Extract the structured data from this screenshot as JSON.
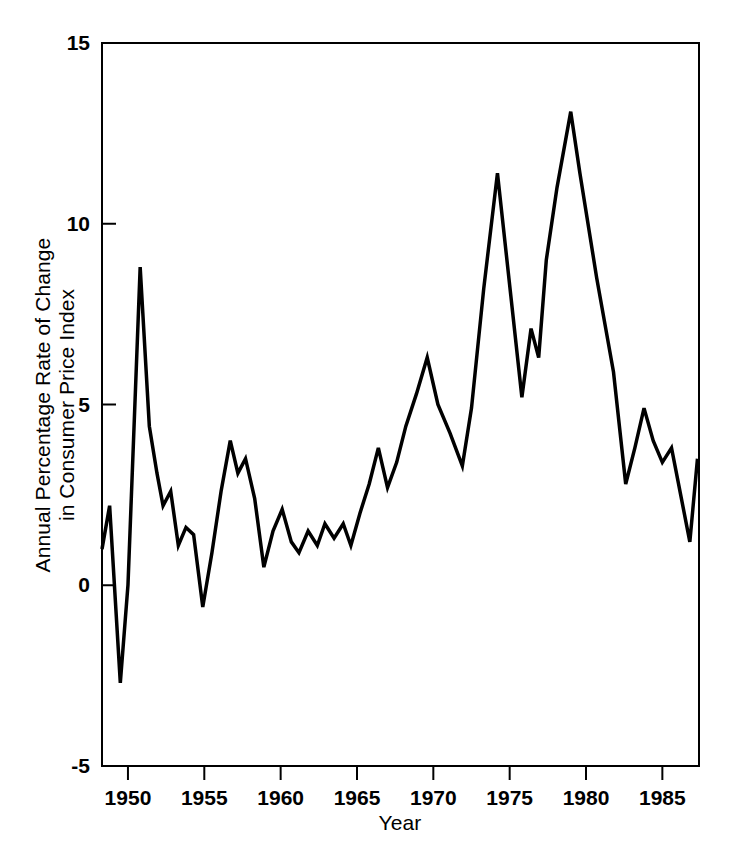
{
  "chart_data": {
    "type": "line",
    "title": "",
    "subtitle": "",
    "xlabel": "Year",
    "ylabel": "Annual Percentage Rate of Change in Consumer Price Index",
    "ylabel_line1": "Annual Percentage Rate of Change",
    "ylabel_line2": "in Consumer Price Index",
    "xlim": [
      1948.3,
      1987.4
    ],
    "ylim": [
      -5,
      15
    ],
    "xticks": [
      1950,
      1955,
      1960,
      1965,
      1970,
      1975,
      1980,
      1985
    ],
    "xtick_labels": [
      "1950",
      "1955",
      "1960",
      "1965",
      "1970",
      "1975",
      "1980",
      "1985"
    ],
    "yticks": [
      -5,
      0,
      5,
      10,
      15
    ],
    "ytick_labels": [
      "-5",
      "0",
      "5",
      "10",
      "15"
    ],
    "grid": false,
    "legend": null,
    "line_color": "#000000",
    "line_width": 3.5,
    "frame_color": "#000000",
    "background": "#ffffff",
    "series": [
      {
        "name": "Annual Percentage Rate of Change in Consumer Price Index",
        "x": [
          1948.3,
          1948.8,
          1949.5,
          1950.0,
          1950.8,
          1951.4,
          1951.9,
          1952.3,
          1952.8,
          1953.3,
          1953.8,
          1954.3,
          1954.9,
          1955.5,
          1956.1,
          1956.7,
          1957.2,
          1957.7,
          1958.3,
          1958.9,
          1959.5,
          1960.1,
          1960.7,
          1961.2,
          1961.8,
          1962.4,
          1962.9,
          1963.5,
          1964.1,
          1964.6,
          1965.2,
          1965.8,
          1966.4,
          1967.0,
          1967.6,
          1968.2,
          1968.9,
          1969.6,
          1970.3,
          1971.1,
          1971.9,
          1972.5,
          1973.3,
          1974.2,
          1975.0,
          1975.8,
          1976.4,
          1976.9,
          1977.4,
          1978.1,
          1979.0,
          1979.6,
          1980.7,
          1981.8,
          1982.6,
          1983.2,
          1983.8,
          1984.4,
          1985.0,
          1985.6,
          1986.2,
          1986.8,
          1987.3
        ],
        "y": [
          1.0,
          2.2,
          -2.7,
          0.0,
          8.8,
          4.4,
          3.1,
          2.2,
          2.6,
          1.1,
          1.6,
          1.4,
          -0.6,
          0.9,
          2.6,
          4.0,
          3.1,
          3.5,
          2.4,
          0.5,
          1.5,
          2.1,
          1.2,
          0.9,
          1.5,
          1.1,
          1.7,
          1.3,
          1.7,
          1.1,
          2.0,
          2.8,
          3.8,
          2.7,
          3.4,
          4.4,
          5.3,
          6.3,
          5.0,
          4.2,
          3.3,
          4.9,
          8.2,
          11.4,
          8.3,
          5.2,
          7.1,
          6.3,
          9.0,
          11.0,
          13.1,
          11.4,
          8.5,
          5.9,
          2.8,
          3.8,
          4.9,
          4.0,
          3.4,
          3.8,
          2.5,
          1.2,
          3.5
        ]
      }
    ]
  },
  "figure": {
    "plot_left_px": 102,
    "plot_right_px": 699,
    "plot_top_px": 43,
    "plot_bottom_px": 766
  }
}
